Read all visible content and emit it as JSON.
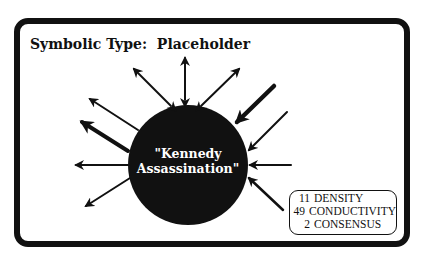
{
  "title": "Symbolic Type:  Placeholder",
  "center_node": {
    "line1": "\"Kennedy",
    "line2": "Assassination\""
  },
  "stats": [
    {
      "value": "11",
      "label": "DENSITY"
    },
    {
      "value": "49",
      "label": "CONDUCTIVITY"
    },
    {
      "value": "2",
      "label": "CONSENSUS"
    }
  ],
  "colors": {
    "ink": "#111111",
    "background": "#ffffff"
  },
  "arrows": [
    {
      "direction": "bidirectional",
      "position": "top",
      "weight": "thin"
    },
    {
      "direction": "bidirectional",
      "position": "upper-left",
      "weight": "thin"
    },
    {
      "direction": "bidirectional",
      "position": "upper-right",
      "weight": "thin"
    },
    {
      "direction": "incoming",
      "position": "upper-right",
      "weight": "thick"
    },
    {
      "direction": "outgoing",
      "position": "left-upper",
      "weight": "thin"
    },
    {
      "direction": "outgoing",
      "position": "left-upper",
      "weight": "thick"
    },
    {
      "direction": "outgoing",
      "position": "left",
      "weight": "thin"
    },
    {
      "direction": "outgoing",
      "position": "lower-left",
      "weight": "thin"
    },
    {
      "direction": "incoming",
      "position": "right-upper",
      "weight": "thin"
    },
    {
      "direction": "incoming",
      "position": "right",
      "weight": "thin"
    },
    {
      "direction": "incoming",
      "position": "lower-right",
      "weight": "thin"
    }
  ]
}
